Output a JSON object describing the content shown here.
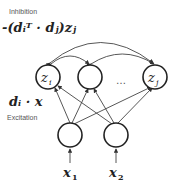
{
  "labels": {
    "inhibition": "Inhibition",
    "excitation": "Excitation",
    "inhibition_formula": "-(dᵢᵀ · dⱼ)zⱼ",
    "excitation_formula": "dᵢ · x",
    "ellipsis": "…"
  },
  "nodes": {
    "top": [
      {
        "id": "z_i",
        "label": "z",
        "sub": "i"
      },
      {
        "id": "middle",
        "label": "",
        "sub": ""
      },
      {
        "id": "z_j",
        "label": "z",
        "sub": "j"
      }
    ],
    "bottom": [
      {
        "id": "n1",
        "input": "x",
        "input_sub": "1"
      },
      {
        "id": "n2",
        "input": "x",
        "input_sub": "2"
      }
    ]
  },
  "colors": {
    "stroke": "#333333",
    "text": "#222222",
    "muted": "#555555"
  }
}
